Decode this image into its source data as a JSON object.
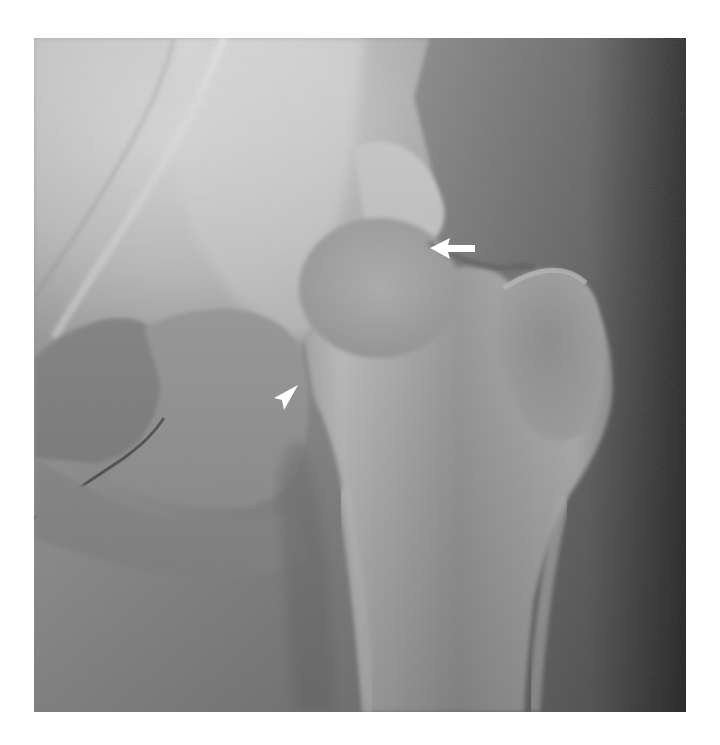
{
  "image": {
    "subject": "Hip joint radiograph (AP view)",
    "modality": "X-ray",
    "colors": {
      "background": "#ffffff",
      "bone_light": "#d8d8d8",
      "soft_tissue": "#8a8a8a",
      "dark_edge": "#3a3a3a",
      "annotation": "#ffffff"
    },
    "frame": {
      "x": 34,
      "y": 38,
      "width": 652,
      "height": 674
    }
  },
  "annotations": [
    {
      "type": "arrow",
      "direction": "left",
      "x": 448,
      "y": 252,
      "label": "arrow"
    },
    {
      "type": "arrowhead",
      "direction": "up-right",
      "x": 284,
      "y": 405,
      "label": "arrowhead"
    }
  ]
}
